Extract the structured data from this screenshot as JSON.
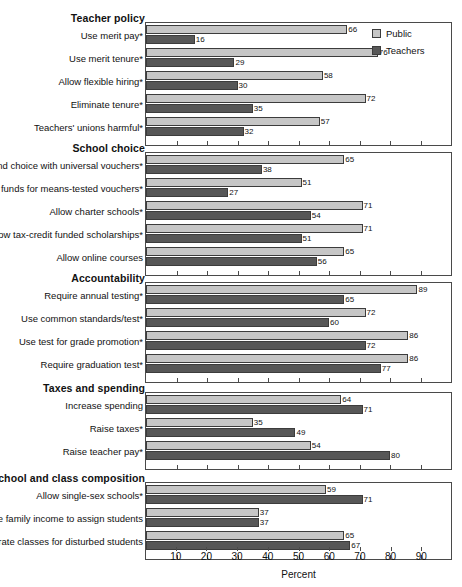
{
  "chart_data": {
    "type": "bar",
    "orientation": "horizontal",
    "title": "",
    "xlabel": "Percent",
    "ylabel": "",
    "xlim": [
      0,
      100
    ],
    "xticks": [
      10,
      20,
      30,
      40,
      50,
      60,
      70,
      80,
      90
    ],
    "xtick_labels": [
      "10",
      "20",
      "30",
      "40",
      "50",
      "60",
      "70",
      "80",
      "90"
    ],
    "grid": false,
    "legend_position": "top-right",
    "series": [
      {
        "name": "Public",
        "color": "#c6c6c6"
      },
      {
        "name": "Teachers",
        "color": "#575757"
      }
    ],
    "groups": [
      {
        "title": "Teacher policy",
        "items": [
          {
            "label": "Use merit pay*",
            "public": 66,
            "teachers": 16
          },
          {
            "label": "Use merit tenure*",
            "public": 76,
            "teachers": 29
          },
          {
            "label": "Allow flexible hiring*",
            "public": 58,
            "teachers": 30
          },
          {
            "label": "Eliminate tenure*",
            "public": 72,
            "teachers": 35
          },
          {
            "label": "Teachers' unions harmful*",
            "public": 57,
            "teachers": 32
          }
        ]
      },
      {
        "title": "School choice",
        "items": [
          {
            "label": "Expand choice with universal vouchers*",
            "public": 65,
            "teachers": 38
          },
          {
            "label": "Use govt funds for means-tested vouchers*",
            "public": 51,
            "teachers": 27
          },
          {
            "label": "Allow charter schools*",
            "public": 71,
            "teachers": 54
          },
          {
            "label": "Allow tax-credit funded scholarships*",
            "public": 71,
            "teachers": 51
          },
          {
            "label": "Allow online courses",
            "public": 65,
            "teachers": 56
          }
        ]
      },
      {
        "title": "Accountability",
        "items": [
          {
            "label": "Require annual testing*",
            "public": 89,
            "teachers": 65
          },
          {
            "label": "Use common standards/test*",
            "public": 72,
            "teachers": 60
          },
          {
            "label": "Use test for grade promotion*",
            "public": 86,
            "teachers": 72
          },
          {
            "label": "Require graduation test*",
            "public": 86,
            "teachers": 77
          }
        ]
      },
      {
        "title": "Taxes and spending",
        "items": [
          {
            "label": "Increase spending",
            "public": 64,
            "teachers": 71
          },
          {
            "label": "Raise taxes*",
            "public": 35,
            "teachers": 49
          },
          {
            "label": "Raise teacher pay*",
            "public": 54,
            "teachers": 80
          }
        ]
      },
      {
        "title": "School and class composition",
        "items": [
          {
            "label": "Allow single-sex schools*",
            "public": 59,
            "teachers": 71
          },
          {
            "label": "Use family income to assign students",
            "public": 37,
            "teachers": 37
          },
          {
            "label": "Separate classes for disturbed students",
            "public": 65,
            "teachers": 67
          }
        ]
      }
    ]
  },
  "legend": {
    "items": [
      {
        "label": "Public",
        "swatch": "public"
      },
      {
        "label": "Teachers",
        "swatch": "teachers"
      }
    ]
  },
  "axis": {
    "title": "Percent"
  }
}
